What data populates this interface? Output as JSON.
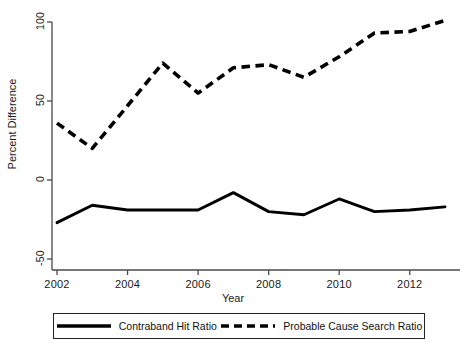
{
  "chart_data": {
    "type": "line",
    "title": "",
    "xlabel": "Year",
    "ylabel": "Percent Difference",
    "x": [
      2002,
      2003,
      2004,
      2005,
      2006,
      2007,
      2008,
      2009,
      2010,
      2011,
      2012,
      2013
    ],
    "xlim": [
      2002,
      2013
    ],
    "ylim": [
      -50,
      105
    ],
    "xticks": [
      2002,
      2004,
      2006,
      2008,
      2010,
      2012
    ],
    "xtick_labels": [
      "2002",
      "2004",
      "2006",
      "2008",
      "2010",
      "2012"
    ],
    "yticks": [
      -50,
      0,
      50,
      100
    ],
    "ytick_labels": [
      "-50",
      "0",
      "50",
      "100"
    ],
    "grid": false,
    "legend_position": "below",
    "series": [
      {
        "name": "Contraband Hit Ratio",
        "style": "solid",
        "color": "#000000",
        "values": [
          -27,
          -16,
          -19,
          -19,
          -19,
          -8,
          -20,
          -22,
          -12,
          -20,
          -19,
          -17
        ]
      },
      {
        "name": "Probable Cause Search Ratio",
        "style": "dashed",
        "color": "#000000",
        "values": [
          36,
          20,
          47,
          74,
          55,
          71,
          73,
          65,
          78,
          93,
          94,
          101
        ]
      }
    ]
  },
  "axes": {
    "y_title": "Percent Difference",
    "x_title": "Year",
    "y_tick_labels": [
      "100",
      "50",
      "0",
      "-50"
    ],
    "x_tick_labels": [
      "2002",
      "2004",
      "2006",
      "2008",
      "2010",
      "2012"
    ]
  },
  "legend": {
    "items": [
      {
        "label": "Contraband Hit Ratio",
        "style": "solid"
      },
      {
        "label": "Probable Cause Search Ratio",
        "style": "dashed"
      }
    ]
  }
}
